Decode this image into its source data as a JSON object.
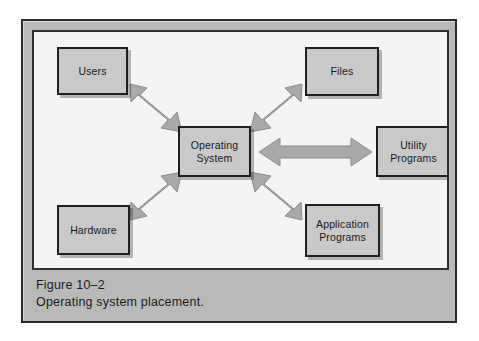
{
  "figure": {
    "caption_number": "Figure 10–2",
    "caption_text": "Operating system placement.",
    "frame_color": "#b9b9b9",
    "panel_color": "#f4f4f2",
    "box_fill_color": "#c9c9c9",
    "box_border_color": "#1f1f1f",
    "arrow_color": "#a9a9a9",
    "arrow_edge_color": "#8f8f8f"
  },
  "diagram": {
    "type": "hub-and-spoke block diagram",
    "center_node": "Operating System",
    "nodes": [
      {
        "id": "users",
        "label": "Users",
        "position": "top-left"
      },
      {
        "id": "files",
        "label": "Files",
        "position": "top-right"
      },
      {
        "id": "operating-system",
        "label": "Operating\nSystem",
        "position": "center"
      },
      {
        "id": "utility-programs",
        "label": "Utility\nPrograms",
        "position": "middle-right"
      },
      {
        "id": "hardware",
        "label": "Hardware",
        "position": "bottom-left"
      },
      {
        "id": "application-programs",
        "label": "Application\nPrograms",
        "position": "bottom-right"
      }
    ],
    "connections": [
      {
        "from": "operating-system",
        "to": "users",
        "style": "double-headed",
        "direction": "diagonal-up-left"
      },
      {
        "from": "operating-system",
        "to": "files",
        "style": "double-headed",
        "direction": "diagonal-up-right"
      },
      {
        "from": "operating-system",
        "to": "utility-programs",
        "style": "double-headed",
        "direction": "horizontal-right"
      },
      {
        "from": "operating-system",
        "to": "hardware",
        "style": "double-headed",
        "direction": "diagonal-down-left"
      },
      {
        "from": "operating-system",
        "to": "application-programs",
        "style": "double-headed",
        "direction": "diagonal-down-right"
      }
    ]
  }
}
